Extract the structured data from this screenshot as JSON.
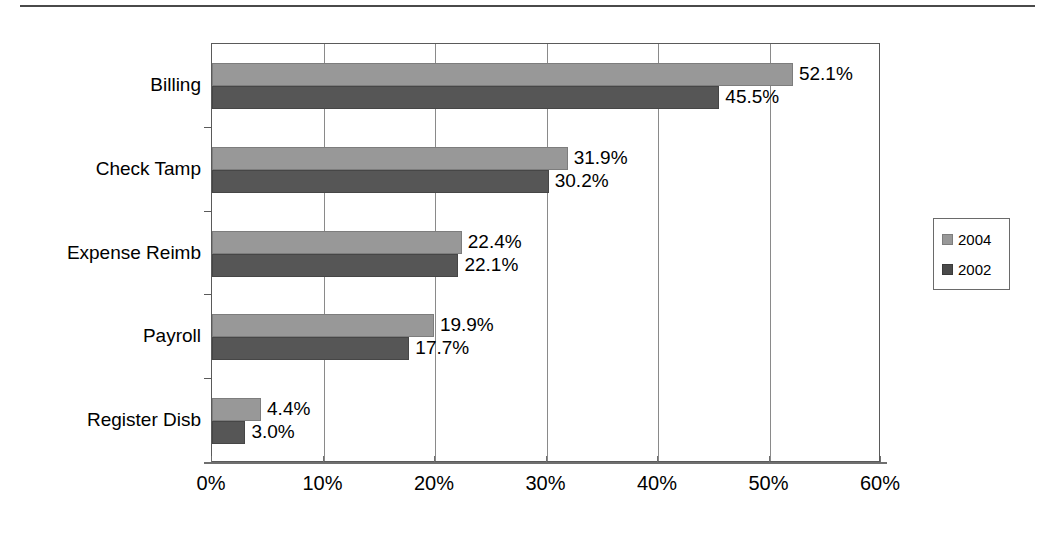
{
  "chart_data": {
    "type": "bar",
    "orientation": "horizontal",
    "title": "",
    "subtitle": "",
    "xlabel": "",
    "ylabel": "",
    "xlim": [
      0,
      60
    ],
    "xtick_values": [
      0,
      10,
      20,
      30,
      40,
      50,
      60
    ],
    "xtick_labels": [
      "0%",
      "10%",
      "20%",
      "30%",
      "40%",
      "50%",
      "60%"
    ],
    "grid": "vertical",
    "legend_position": "right",
    "categories": [
      "Billing",
      "Check Tamp",
      "Expense Reimb",
      "Payroll",
      "Register Disb"
    ],
    "series": [
      {
        "name": "2004",
        "color": "#989898",
        "values": [
          52.1,
          31.9,
          22.4,
          19.9,
          4.4
        ],
        "labels": [
          "52.1%",
          "31.9%",
          "22.4%",
          "19.9%",
          "4.4%"
        ]
      },
      {
        "name": "2002",
        "color": "#565656",
        "values": [
          45.5,
          30.2,
          22.1,
          17.7,
          3.0
        ],
        "labels": [
          "45.5%",
          "30.2%",
          "22.1%",
          "17.7%",
          "3.0%"
        ]
      }
    ]
  },
  "legend": {
    "entries": [
      {
        "label": "2004",
        "color": "#989898"
      },
      {
        "label": "2002",
        "color": "#4a4a4a"
      }
    ]
  },
  "axis": {
    "x_tick_labels": [
      "0%",
      "10%",
      "20%",
      "30%",
      "40%",
      "50%",
      "60%"
    ],
    "category_labels": [
      "Billing",
      "Check Tamp",
      "Expense Reimb",
      "Payroll",
      "Register Disb"
    ]
  }
}
